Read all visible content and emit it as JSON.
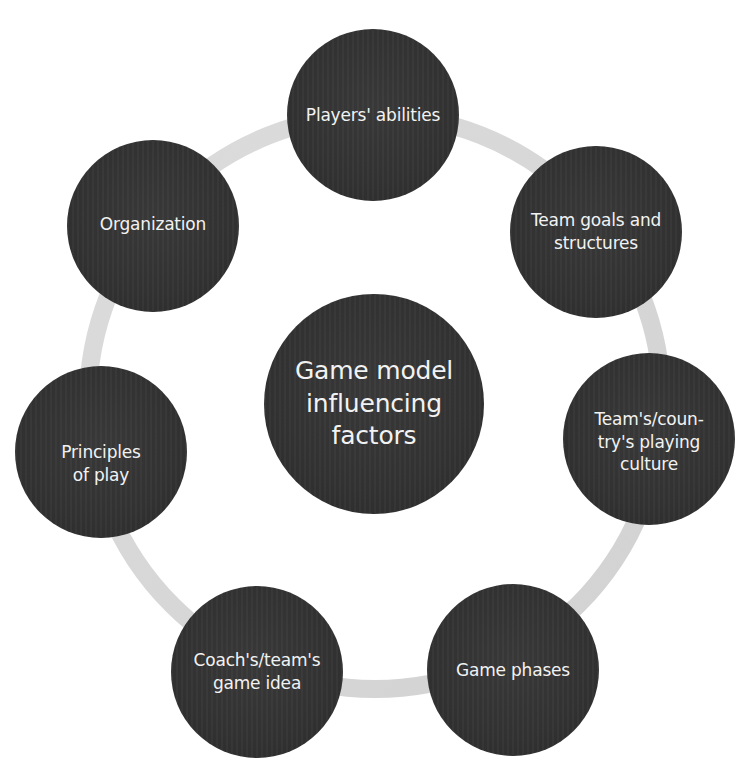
{
  "diagram": {
    "type": "cycle-hub",
    "center": {
      "label": "Game model influencing factors",
      "lines": [
        "Game model",
        "influencing",
        "factors"
      ]
    },
    "nodes": [
      {
        "id": "players-abilities",
        "lines": [
          "Players' abilities"
        ],
        "label": "Players' abilities"
      },
      {
        "id": "team-goals",
        "lines": [
          "Team goals and",
          "structures"
        ],
        "label": "Team goals and structures"
      },
      {
        "id": "playing-culture",
        "lines": [
          "Team's/coun-",
          "try's playing",
          "culture"
        ],
        "label": "Team's/country's playing culture"
      },
      {
        "id": "game-phases",
        "lines": [
          "Game phases"
        ],
        "label": "Game phases"
      },
      {
        "id": "coach-game-idea",
        "lines": [
          "Coach's/team's",
          "game idea"
        ],
        "label": "Coach's/team's game idea"
      },
      {
        "id": "principles-of-play",
        "lines": [
          "Principles",
          "of play"
        ],
        "label": "Principles of play"
      },
      {
        "id": "organization",
        "lines": [
          "Organization"
        ],
        "label": "Organization"
      }
    ],
    "colors": {
      "node_fill": "#333333",
      "node_text": "#f2f2f2",
      "ring": "#d9d9d9",
      "background": "#ffffff"
    }
  }
}
